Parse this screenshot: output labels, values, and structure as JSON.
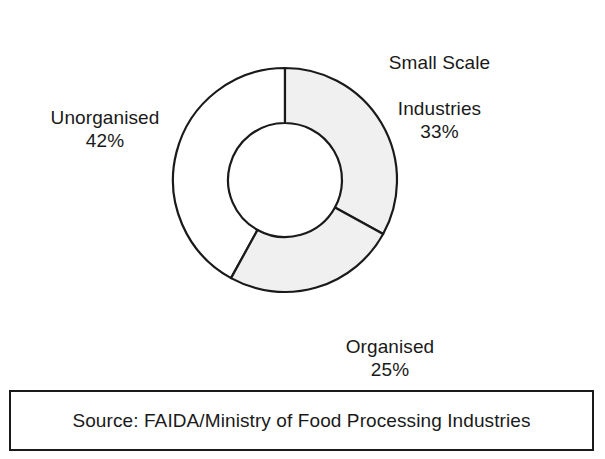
{
  "chart_data": {
    "type": "pie",
    "variant": "donut",
    "title": "",
    "categories": [
      "Small Scale Industries",
      "Organised",
      "Unorganised"
    ],
    "values": [
      33,
      25,
      42
    ],
    "value_unit": "%",
    "labels": [
      "33%",
      "25%",
      "42%"
    ],
    "start_angle_deg": 0,
    "direction": "clockwise",
    "center": {
      "x": 285,
      "y": 180
    },
    "outer_radius": 112,
    "inner_radius": 57,
    "legend": "none",
    "grid": false,
    "slice_colors": [
      "#f0f0f0",
      "#f0f0f0",
      "#ffffff"
    ],
    "stroke_color": "#1a1a1a",
    "slices": [
      {
        "name": "Small Scale Industries",
        "value": 33,
        "label": "33%",
        "fill": "#f0f0f0",
        "start_deg": 0,
        "end_deg": 118.8
      },
      {
        "name": "Organised",
        "value": 25,
        "label": "25%",
        "fill": "#f0f0f0",
        "start_deg": 118.8,
        "end_deg": 208.8
      },
      {
        "name": "Unorganised",
        "value": 42,
        "label": "42%",
        "fill": "#ffffff",
        "start_deg": 208.8,
        "end_deg": 360
      }
    ]
  },
  "labels": {
    "small_scale": {
      "line1": "Small Scale",
      "line2": "Industries",
      "percent": "33%"
    },
    "unorganised": {
      "line1": "Unorganised",
      "percent": "42%"
    },
    "organised": {
      "line1": "Organised",
      "percent": "25%"
    }
  },
  "source": {
    "text": "Source: FAIDA/Ministry of Food Processing Industries"
  }
}
